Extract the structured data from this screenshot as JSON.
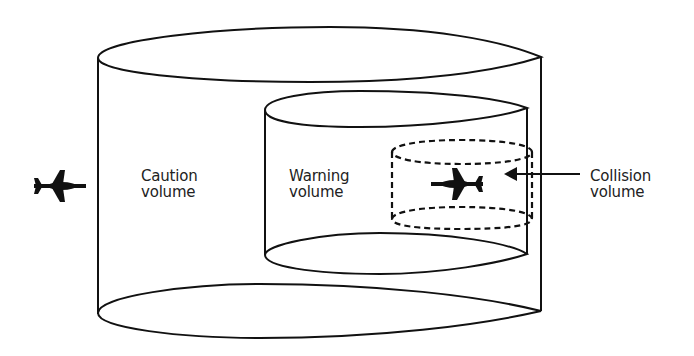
{
  "figure": {
    "type": "nested-cylinder-diagram",
    "background": "#ffffff",
    "stroke_color": "#111111"
  },
  "labels": {
    "caution": {
      "line1": "Caution",
      "line2": "volume"
    },
    "warning": {
      "line1": "Warning",
      "line2": "volume"
    },
    "collision": {
      "line1": "Collision",
      "line2": "volume"
    }
  },
  "volumes": [
    {
      "name": "Caution volume",
      "style": "solid",
      "role": "outer"
    },
    {
      "name": "Warning volume",
      "style": "solid",
      "role": "middle"
    },
    {
      "name": "Collision volume",
      "style": "dashed",
      "role": "inner"
    }
  ],
  "icons": {
    "intruder_aircraft": "airplane-icon",
    "own_aircraft": "airplane-icon",
    "pointer": "arrow-left-icon"
  }
}
